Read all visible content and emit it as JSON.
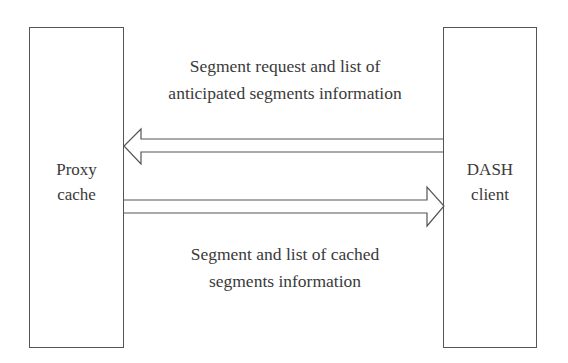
{
  "diagram": {
    "nodes": [
      {
        "id": "proxy",
        "label_line1": "Proxy",
        "label_line2": "cache"
      },
      {
        "id": "dash",
        "label_line1": "DASH",
        "label_line2": "client"
      }
    ],
    "edges": [
      {
        "from": "dash",
        "to": "proxy",
        "label_line1": "Segment request and list of",
        "label_line2": "anticipated segments information"
      },
      {
        "from": "proxy",
        "to": "dash",
        "label_line1": "Segment and list of cached",
        "label_line2": "segments information"
      }
    ],
    "colors": {
      "stroke": "#555555",
      "text": "#3a3a3a",
      "background": "#ffffff"
    }
  }
}
